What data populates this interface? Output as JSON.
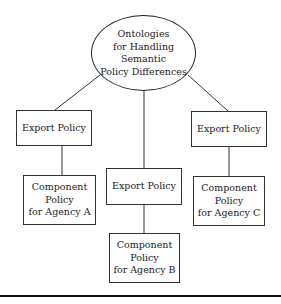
{
  "diagram": {
    "root": {
      "label": "Ontologies\nfor Handling Semantic\nPolicy Differences"
    },
    "branches": [
      {
        "export_label": "Export Policy",
        "component_label": "Component\nPolicy\nfor Agency A"
      },
      {
        "export_label": "Export Policy",
        "component_label": "Component\nPolicy\nfor Agency B"
      },
      {
        "export_label": "Export Policy",
        "component_label": "Component\nPolicy\nfor Agency C"
      }
    ],
    "colors": {
      "stroke": "#222222",
      "background": "#ffffff"
    }
  }
}
